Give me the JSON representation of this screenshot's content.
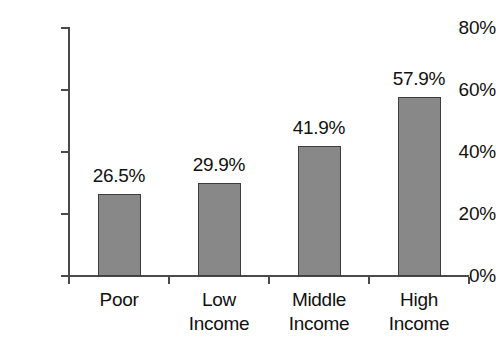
{
  "chart_data": {
    "type": "bar",
    "title": "",
    "subtitle": "",
    "xlabel": "",
    "ylabel": "",
    "categories": [
      "Poor",
      "Low Income",
      "Middle Income",
      "High Income"
    ],
    "category_lines": [
      {
        "line1": "Poor",
        "line2": ""
      },
      {
        "line1": "Low",
        "line2": "Income"
      },
      {
        "line1": "Middle",
        "line2": "Income"
      },
      {
        "line1": "High",
        "line2": "Income"
      }
    ],
    "values": [
      26.5,
      29.9,
      41.9,
      57.9
    ],
    "value_labels": [
      "26.5%",
      "29.9%",
      "41.9%",
      "57.9%"
    ],
    "ylim": [
      0,
      80
    ],
    "ytick_values": [
      0,
      20,
      40,
      60,
      80
    ],
    "ytick_labels": [
      "0%",
      "20%",
      "40%",
      "60%",
      "80%"
    ],
    "grid": false,
    "legend": false,
    "bar_fill_color": "#888888",
    "bar_border_color": "#3d3d3d",
    "axis_color": "#4a4a4a",
    "text_color": "#111111",
    "background_color": "#ffffff"
  }
}
